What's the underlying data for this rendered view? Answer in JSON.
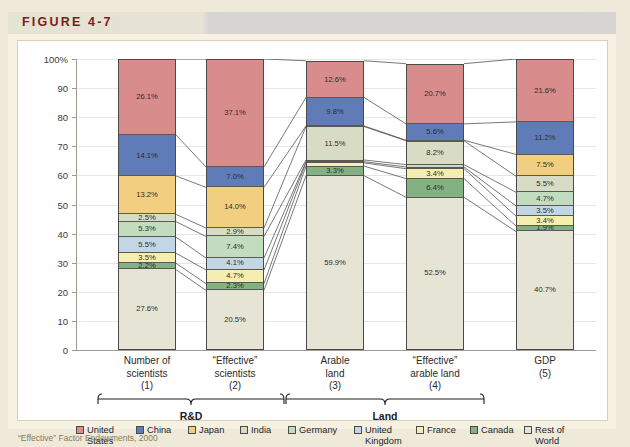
{
  "figure": {
    "label": "FIGURE 4-7",
    "caption": "“Effective” Factor Endowments, 2000"
  },
  "legend": {
    "position": "bottom",
    "items": [
      {
        "label": "United\nStates",
        "color": "#d98c8c"
      },
      {
        "label": "China",
        "color": "#5f7cb8"
      },
      {
        "label": "Japan",
        "color": "#f2ce80"
      },
      {
        "label": "India",
        "color": "#d8dcc4"
      },
      {
        "label": "Germany",
        "color": "#c2dcc0"
      },
      {
        "label": "United\nKingdom",
        "color": "#c3d6e6"
      },
      {
        "label": "France",
        "color": "#f5eeb0"
      },
      {
        "label": "Canada",
        "color": "#84b184"
      },
      {
        "label": "Rest of\nWorld",
        "color": "#e6e4d5"
      }
    ]
  },
  "groups": [
    {
      "label": "R&D",
      "from": 0,
      "to": 1
    },
    {
      "label": "Land",
      "from": 2,
      "to": 3
    }
  ],
  "chart_data": {
    "type": "bar",
    "title": "",
    "subtitle": "",
    "xlabel": "",
    "ylabel": "",
    "ylim": [
      0,
      100
    ],
    "yticks": [
      "0",
      "10",
      "20",
      "30",
      "40",
      "50",
      "60",
      "70",
      "80",
      "90",
      "100%"
    ],
    "grid": true,
    "stacked": true,
    "stack_order_top_to_bottom": [
      "United States",
      "China",
      "Japan",
      "India",
      "Germany",
      "United Kingdom",
      "France",
      "Canada",
      "Rest of World"
    ],
    "categories": [
      "Number of\nscientists\n(1)",
      "“Effective”\nscientists\n(2)",
      "Arable\nland\n(3)",
      "“Effective”\narable land\n(4)",
      "GDP\n(5)"
    ],
    "series": [
      {
        "name": "United States",
        "color": "#d98c8c",
        "values": [
          26.1,
          37.1,
          12.6,
          20.7,
          21.6
        ]
      },
      {
        "name": "China",
        "color": "#5f7cb8",
        "values": [
          14.1,
          7.0,
          9.8,
          5.6,
          11.2
        ]
      },
      {
        "name": "Japan",
        "color": "#f2ce80",
        "values": [
          13.2,
          14.0,
          0.2,
          0.2,
          7.5
        ]
      },
      {
        "name": "India",
        "color": "#d8dcc4",
        "values": [
          2.5,
          2.9,
          11.5,
          8.2,
          5.5
        ]
      },
      {
        "name": "Germany",
        "color": "#c2dcc0",
        "values": [
          5.3,
          7.4,
          0.6,
          0.8,
          4.7
        ]
      },
      {
        "name": "United Kingdom",
        "color": "#c3d6e6",
        "values": [
          5.5,
          4.1,
          0.4,
          0.6,
          3.5
        ]
      },
      {
        "name": "France",
        "color": "#f5eeb0",
        "values": [
          3.5,
          4.7,
          1.1,
          3.4,
          3.4
        ]
      },
      {
        "name": "Canada",
        "color": "#84b184",
        "values": [
          2.2,
          2.3,
          3.3,
          6.4,
          1.9
        ]
      },
      {
        "name": "Rest of World",
        "color": "#e6e4d5",
        "values": [
          27.6,
          20.5,
          59.9,
          52.5,
          40.7
        ]
      }
    ],
    "value_labels": [
      [
        "26.1%",
        "37.1%",
        "12.6%",
        "20.7%",
        "21.6%"
      ],
      [
        "14.1%",
        "7.0%",
        "9.8%",
        "5.6%",
        "11.2%"
      ],
      [
        "13.2%",
        "14.0%",
        "",
        "",
        "7.5%"
      ],
      [
        "2.5%",
        "2.9%",
        "11.5%",
        "8.2%",
        "5.5%"
      ],
      [
        "5.3%",
        "7.4%",
        "",
        "",
        "4.7%"
      ],
      [
        "5.5%",
        "4.1%",
        "",
        "",
        "3.5%"
      ],
      [
        "3.5%",
        "4.7%",
        "",
        "3.4%",
        "3.4%"
      ],
      [
        "2.2%",
        "2.3%",
        "3.3%",
        "6.4%",
        "1.9%"
      ],
      [
        "27.6%",
        "20.5%",
        "59.9%",
        "52.5%",
        "40.7%"
      ]
    ]
  }
}
